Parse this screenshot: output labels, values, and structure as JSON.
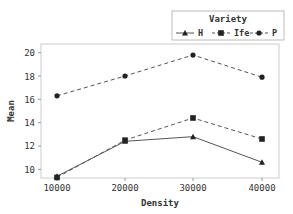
{
  "chart_data": {
    "type": "line",
    "title": "",
    "xlabel": "Density",
    "ylabel": "Mean",
    "categories": [
      "10000",
      "20000",
      "30000",
      "40000"
    ],
    "yticks": [
      "10",
      "12",
      "14",
      "16",
      "18",
      "20"
    ],
    "ylim": [
      9.3,
      20.8
    ],
    "legend": {
      "title": "Variety",
      "position": "top-right",
      "entries": [
        "H",
        "Ife",
        "P"
      ]
    },
    "grid": false,
    "series": [
      {
        "name": "H",
        "marker": "triangle",
        "line": "solid",
        "values": [
          9.4,
          12.4,
          12.8,
          10.6
        ]
      },
      {
        "name": "Ife",
        "marker": "square",
        "line": "dashed",
        "values": [
          9.3,
          12.5,
          14.4,
          12.6
        ]
      },
      {
        "name": "P",
        "marker": "circle",
        "line": "dashed",
        "values": [
          16.3,
          18.0,
          19.8,
          17.9
        ]
      }
    ]
  }
}
